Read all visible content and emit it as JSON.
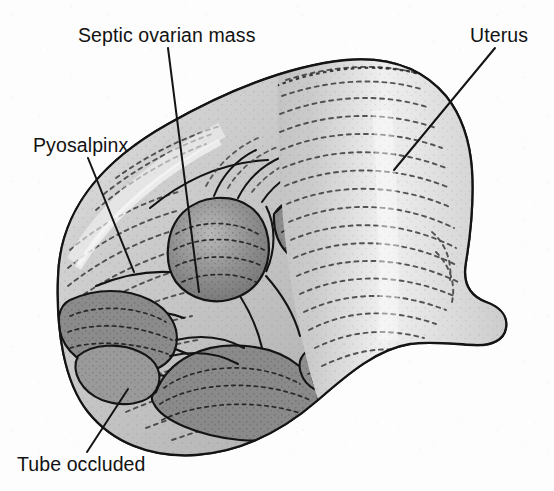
{
  "figure": {
    "kind": "anatomical-illustration",
    "style": "grayscale stippled line drawing",
    "background_color": "#fdfdfd",
    "ink_color": "#141414",
    "tissue_fill_light": "#d2d2d2",
    "tissue_fill_mid": "#b4b4b4",
    "tissue_fill_dark": "#8d8d8d",
    "tissue_fill_darkest": "#6f6f6f",
    "highlight_color": "#f2f2f2"
  },
  "labels": [
    {
      "id": "septic-ovarian-mass",
      "text": "Septic ovarian mass",
      "text_x": 78,
      "text_y": 26,
      "leader": {
        "x1": 168,
        "y1": 48,
        "x2": 199,
        "y2": 292
      }
    },
    {
      "id": "uterus",
      "text": "Uterus",
      "text_x": 470,
      "text_y": 26,
      "leader": {
        "x1": 495,
        "y1": 48,
        "x2": 394,
        "y2": 170
      }
    },
    {
      "id": "pyosalpinx",
      "text": "Pyosalpinx",
      "text_x": 33,
      "text_y": 136,
      "leader": {
        "x1": 88,
        "y1": 158,
        "x2": 134,
        "y2": 272
      }
    },
    {
      "id": "tube-occluded",
      "text": "Tube occluded",
      "text_x": 17,
      "text_y": 462,
      "leader": {
        "x1": 87,
        "y1": 452,
        "x2": 128,
        "y2": 389
      }
    }
  ]
}
